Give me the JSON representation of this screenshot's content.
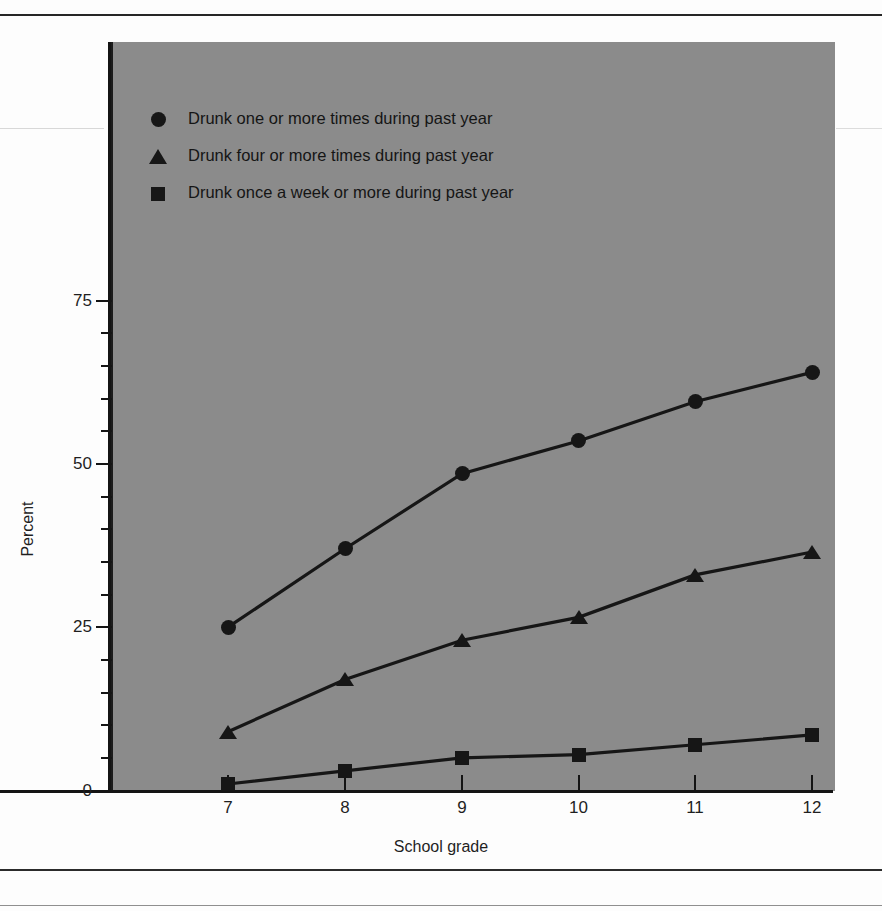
{
  "chart_data": {
    "type": "line",
    "title": "",
    "subtitle": "",
    "xlabel": "School grade",
    "ylabel": "Percent",
    "categories": [
      "7",
      "8",
      "9",
      "10",
      "11",
      "12"
    ],
    "x": [
      7,
      8,
      9,
      10,
      11,
      12
    ],
    "xlim": [
      6.5,
      12.5
    ],
    "ylim": [
      0,
      78
    ],
    "ytick_major": [
      0,
      25,
      50,
      75
    ],
    "ytick_minor": [
      5,
      10,
      15,
      20,
      30,
      35,
      40,
      45,
      55,
      60,
      65,
      70
    ],
    "ytick_labels": [
      "0",
      "25",
      "50",
      "75"
    ],
    "grid": false,
    "legend_position": "top-left",
    "plot_background": "#8b8b8b",
    "series_color": "#161616",
    "series": [
      {
        "name": "Drunk one or more times during past year",
        "marker": "circle",
        "values": [
          25,
          37,
          48.5,
          53.5,
          59.5,
          64
        ]
      },
      {
        "name": "Drunk four or more times during past year",
        "marker": "triangle",
        "values": [
          9,
          17,
          23,
          26.5,
          33,
          36.5
        ]
      },
      {
        "name": "Drunk once a week or more during past year",
        "marker": "square",
        "values": [
          1,
          3,
          5,
          5.5,
          7,
          8.5
        ]
      }
    ]
  },
  "legend": {
    "items": [
      {
        "marker": "circle",
        "label": "Drunk one or more times during past year"
      },
      {
        "marker": "triangle",
        "label": "Drunk four or more times during past year"
      },
      {
        "marker": "square",
        "label": "Drunk once a week or more during past year"
      }
    ]
  },
  "axes": {
    "x_title": "School grade",
    "y_title": "Percent",
    "x_labels": [
      "7",
      "8",
      "9",
      "10",
      "11",
      "12"
    ],
    "y_labels": [
      "75",
      "50",
      "25",
      "0"
    ]
  }
}
